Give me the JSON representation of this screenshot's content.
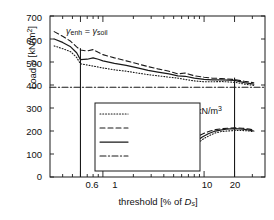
{
  "chart_data": {
    "type": "line",
    "title": "",
    "xlabel": "threshold [% of D_s]",
    "ylabel": "Load p [kN/m²]",
    "xscale": "log",
    "xlim": [
      0.3,
      40
    ],
    "ylim": [
      0,
      700
    ],
    "yticks": [
      0,
      100,
      200,
      300,
      400,
      500,
      600,
      700
    ],
    "xticks": [
      0.6,
      1,
      10,
      20
    ],
    "xtick_labels": [
      "0.6",
      "1",
      "10",
      "20"
    ],
    "grid": false,
    "legend_position": "center-left",
    "series": [
      {
        "name": "Lower",
        "style": "dotted",
        "group": "gamma_enh_equals_gamma_soil",
        "x": [
          0.33,
          0.4,
          0.48,
          0.55,
          0.6,
          0.7,
          0.8,
          0.9,
          1.0,
          1.3,
          1.7,
          2.2,
          2.8,
          3.5,
          4.5,
          5.5,
          6.5,
          8.0,
          10.0,
          12.0,
          15.0,
          20.0,
          25.0,
          31.0
        ],
        "y": [
          570,
          558,
          545,
          520,
          492,
          487,
          482,
          478,
          474,
          466,
          460,
          452,
          445,
          440,
          434,
          430,
          424,
          418,
          414,
          414,
          415,
          412,
          404,
          398
        ]
      },
      {
        "name": "Upper",
        "style": "dashed",
        "group": "gamma_enh_equals_gamma_soil",
        "x": [
          0.33,
          0.4,
          0.48,
          0.55,
          0.6,
          0.7,
          0.8,
          0.9,
          1.0,
          1.3,
          1.7,
          2.2,
          2.8,
          3.5,
          4.5,
          5.5,
          6.5,
          8.0,
          10.0,
          12.0,
          15.0,
          20.0,
          25.0,
          31.0
        ],
        "y": [
          632,
          612,
          590,
          566,
          552,
          548,
          554,
          542,
          532,
          518,
          505,
          492,
          480,
          470,
          460,
          448,
          452,
          440,
          434,
          430,
          428,
          424,
          416,
          410
        ]
      },
      {
        "name": "Mean",
        "style": "solid",
        "group": "gamma_enh_equals_gamma_soil",
        "x": [
          0.33,
          0.4,
          0.48,
          0.55,
          0.6,
          0.7,
          0.8,
          0.9,
          1.0,
          1.3,
          1.7,
          2.2,
          2.8,
          3.5,
          4.5,
          5.5,
          6.5,
          8.0,
          10.0,
          12.0,
          15.0,
          20.0,
          25.0,
          31.0
        ],
        "y": [
          600,
          585,
          566,
          540,
          510,
          512,
          518,
          512,
          505,
          494,
          485,
          474,
          464,
          456,
          448,
          440,
          438,
          430,
          424,
          422,
          422,
          420,
          410,
          404
        ]
      },
      {
        "name": "Lower",
        "style": "dotted",
        "group": "gamma_enh_equals_23",
        "x": [
          4.6,
          5.2,
          6.0,
          6.8,
          7.6,
          8.6,
          10.0,
          11.5,
          13.0,
          15.0,
          17.0,
          20.0,
          24.0,
          28.0,
          31.0
        ],
        "y": [
          30,
          52,
          78,
          102,
          124,
          146,
          168,
          182,
          192,
          198,
          200,
          202,
          202,
          200,
          196
        ]
      },
      {
        "name": "Upper",
        "style": "dashed",
        "group": "gamma_enh_equals_23",
        "x": [
          4.1,
          4.6,
          5.2,
          6.0,
          6.8,
          7.6,
          8.6,
          10.0,
          11.5,
          13.0,
          15.0,
          17.0,
          20.0,
          24.0,
          28.0,
          31.0
        ],
        "y": [
          44,
          80,
          106,
          126,
          142,
          160,
          176,
          190,
          200,
          206,
          210,
          212,
          214,
          212,
          208,
          204
        ]
      },
      {
        "name": "Mean",
        "style": "solid",
        "group": "gamma_enh_equals_23",
        "x": [
          4.4,
          5.0,
          5.8,
          6.6,
          7.4,
          8.4,
          9.6,
          11.0,
          12.5,
          14.5,
          16.5,
          20.0,
          24.0,
          28.0,
          31.0
        ],
        "y": [
          38,
          66,
          94,
          116,
          136,
          156,
          174,
          188,
          198,
          204,
          208,
          210,
          208,
          204,
          200
        ]
      },
      {
        "name": "original bvp",
        "style": "dashdot",
        "group": "reference",
        "x": [
          0.3,
          40
        ],
        "y": [
          390,
          390
        ]
      }
    ],
    "markers": [
      {
        "name": "threshold-0.6-line",
        "x": 0.6,
        "y_from": 0,
        "y_to": 560
      },
      {
        "name": "threshold-20-line",
        "x": 20.0,
        "y_from": 0,
        "y_to": 432
      }
    ],
    "annotations": [
      {
        "name": "gamma-enh-soil-annotation",
        "text": "γ_enh = γ_soil",
        "x_px": 72,
        "y_px": 32
      },
      {
        "name": "gamma-enh-23-annotation",
        "text": "γ_enh = 23 kN/m³",
        "x_px": 163,
        "y_px": 110
      }
    ],
    "legend_entries": [
      {
        "label": "Lower",
        "style": "dotted"
      },
      {
        "label": "Upper",
        "style": "dashed"
      },
      {
        "label": "Mean",
        "style": "solid"
      },
      {
        "label": "original bvp",
        "style": "dashdot"
      }
    ]
  },
  "axis": {
    "ylabel_prefix": "Load",
    "ylabel_symbol": "p",
    "ylabel_unit": "[kN/m²]",
    "xlabel_prefix": "threshold [% of",
    "xlabel_symbol": "D",
    "xlabel_symbol_sub": "s",
    "xlabel_suffix": "]"
  },
  "annotation_parts": {
    "gamma": "γ",
    "enh": "enh",
    "eq": "=",
    "soil": "soil",
    "value_23": "23 kN/m",
    "cube": "3"
  },
  "colors": {
    "line": "#1a1a1a",
    "axis": "#4d4d4d",
    "background": "#ffffff"
  }
}
